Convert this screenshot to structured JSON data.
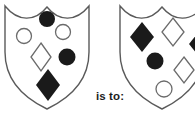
{
  "figure": {
    "type": "visual-analogy-puzzle",
    "relation_label": "is to:",
    "background_color": "#ffffff",
    "outline_color": "#5a5a5a",
    "filled_color": "#1a1a1a",
    "open_color": "#6b6b6b"
  },
  "shields": [
    {
      "id": "shield-left",
      "position": "left",
      "clipped": false,
      "symbols": [
        {
          "shape": "circle",
          "fill": "filled",
          "position": "top-center"
        },
        {
          "shape": "circle",
          "fill": "open",
          "position": "upper-right"
        },
        {
          "shape": "circle",
          "fill": "open",
          "position": "upper-left"
        },
        {
          "shape": "diamond",
          "fill": "open",
          "position": "center"
        },
        {
          "shape": "circle",
          "fill": "filled",
          "position": "mid-right"
        },
        {
          "shape": "diamond",
          "fill": "filled",
          "position": "bottom-center"
        }
      ]
    },
    {
      "id": "shield-right",
      "position": "right",
      "clipped": true,
      "symbols": [
        {
          "shape": "diamond",
          "fill": "filled",
          "position": "upper-left"
        },
        {
          "shape": "diamond",
          "fill": "open",
          "position": "top-center"
        },
        {
          "shape": "diamond",
          "fill": "filled",
          "position": "mid-right"
        },
        {
          "shape": "circle",
          "fill": "filled",
          "position": "center"
        },
        {
          "shape": "diamond",
          "fill": "open",
          "position": "lower-right"
        },
        {
          "shape": "circle",
          "fill": "open",
          "position": "bottom-center"
        }
      ]
    }
  ]
}
